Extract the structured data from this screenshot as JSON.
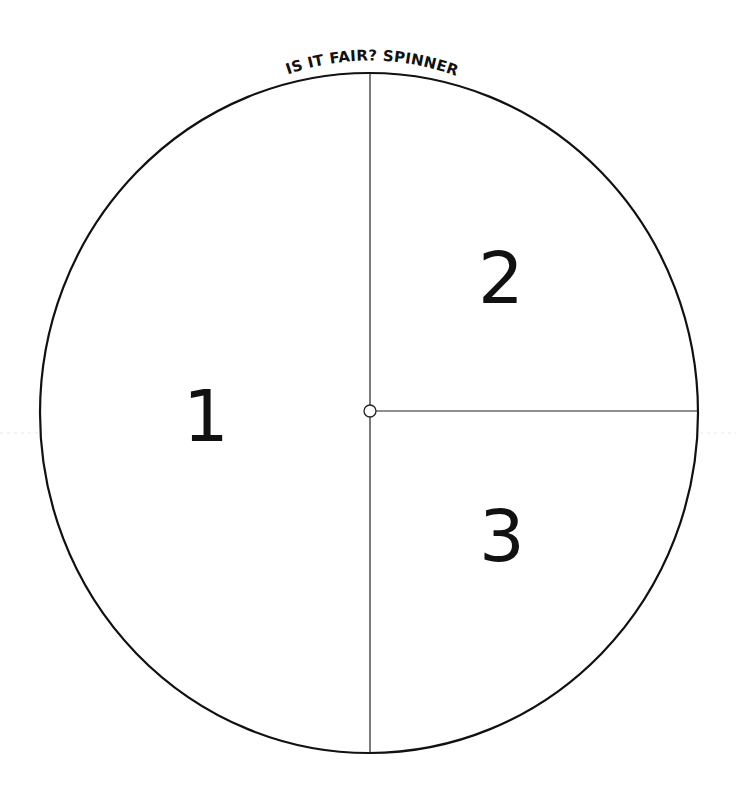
{
  "title": "IS IT FAIR? SPINNER",
  "spinner": {
    "sections": [
      {
        "label": "1",
        "portion": "left half"
      },
      {
        "label": "2",
        "portion": "upper-right quarter"
      },
      {
        "label": "3",
        "portion": "lower-right quarter"
      }
    ],
    "outline_color": "#111111",
    "background_color": "#ffffff"
  }
}
